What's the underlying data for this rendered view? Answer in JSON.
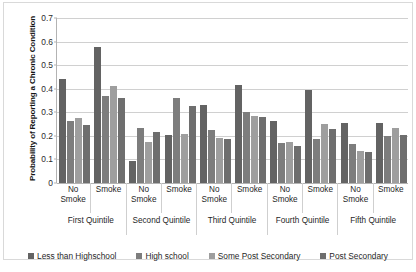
{
  "chart_data": {
    "type": "bar",
    "title": "",
    "subtitle": "",
    "xlabel": "",
    "ylabel": "Probability of Reporting a Chronic Condition",
    "ylim": [
      0,
      0.7
    ],
    "ytick_labels": [
      "0",
      "0.1",
      "0.2",
      "0.3",
      "0.4",
      "0.5",
      "0.6",
      "0.7"
    ],
    "ytick_values": [
      0,
      0.1,
      0.2,
      0.3,
      0.4,
      0.5,
      0.6,
      0.7
    ],
    "grid": true,
    "legend_position": "bottom",
    "categories": [
      "No Smoke",
      "Smoke",
      "No Smoke",
      "Smoke",
      "No Smoke",
      "Smoke",
      "No Smoke",
      "Smoke",
      "No Smoke",
      "Smoke"
    ],
    "group_labels": [
      "First Quintile",
      "Second Quintile",
      "Third Quintile",
      "Fourth Quintile",
      "Fifth Quintile"
    ],
    "series": [
      {
        "name": "Less than Highschool",
        "color": "#636363",
        "values": [
          0.44,
          0.575,
          0.095,
          0.205,
          0.33,
          0.415,
          0.265,
          0.395,
          0.255,
          0.255
        ]
      },
      {
        "name": "High school",
        "color": "#7d7d7d",
        "values": [
          0.265,
          0.37,
          0.235,
          0.36,
          0.225,
          0.3,
          0.17,
          0.185,
          0.165,
          0.2
        ]
      },
      {
        "name": "Some Post Secondary",
        "color": "#9e9e9e",
        "values": [
          0.275,
          0.41,
          0.175,
          0.21,
          0.19,
          0.285,
          0.175,
          0.25,
          0.135,
          0.235
        ]
      },
      {
        "name": "Post Secondary",
        "color": "#6e6e6e",
        "values": [
          0.245,
          0.36,
          0.215,
          0.325,
          0.185,
          0.28,
          0.155,
          0.23,
          0.13,
          0.205
        ]
      }
    ]
  },
  "legend": {
    "items": [
      {
        "label": "Less than Highschool",
        "swatch": "s0"
      },
      {
        "label": "High school",
        "swatch": "s1"
      },
      {
        "label": "Some Post Secondary",
        "swatch": "s2"
      },
      {
        "label": "Post Secondary",
        "swatch": "s3"
      }
    ]
  },
  "axis": {
    "y_title": "Probability of Reporting a Chronic Condition"
  }
}
